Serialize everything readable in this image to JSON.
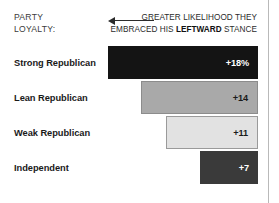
{
  "header": {
    "left_label_line1": "PARTY",
    "left_label_line2": "LOYALTY:",
    "caption_line1": "GREATER LIKELIHOOD THEY",
    "caption_line2_pre": "EMBRACED HIS ",
    "caption_line2_bold": "LEFTWARD",
    "caption_line2_post": " STANCE",
    "arrow_direction": "left"
  },
  "colors": {
    "bar_strong_republican": "#141414",
    "bar_lean_republican": "#a9a9a9",
    "bar_weak_republican": "#e2e2e2",
    "bar_independent": "#3a3a3a",
    "rule": "#b9b9b9",
    "text": "#1a1a1a"
  },
  "chart_data": {
    "type": "bar",
    "orientation": "horizontal",
    "title": "",
    "subtitle": "",
    "xlabel": "",
    "ylabel": "PARTY LOYALTY:",
    "annotation": "GREATER LIKELIHOOD THEY EMBRACED HIS LEFTWARD STANCE",
    "grid": false,
    "legend": false,
    "anchor": "right",
    "categories": [
      "Strong Republican",
      "Lean Republican",
      "Weak Republican",
      "Independent"
    ],
    "values": [
      18,
      14,
      11,
      7
    ],
    "value_labels": [
      "+18%",
      "+14",
      "+11",
      "+7"
    ],
    "xlim": [
      0,
      20
    ],
    "bars": [
      {
        "label": "Strong Republican",
        "value": 18,
        "value_label": "+18%",
        "color": "#141414",
        "style": "black"
      },
      {
        "label": "Lean Republican",
        "value": 14,
        "value_label": "+14",
        "color": "#a9a9a9",
        "style": "mid"
      },
      {
        "label": "Weak Republican",
        "value": 11,
        "value_label": "+11",
        "color": "#e2e2e2",
        "style": "light"
      },
      {
        "label": "Independent",
        "value": 7,
        "value_label": "+7",
        "color": "#3a3a3a",
        "style": "dark"
      }
    ]
  }
}
